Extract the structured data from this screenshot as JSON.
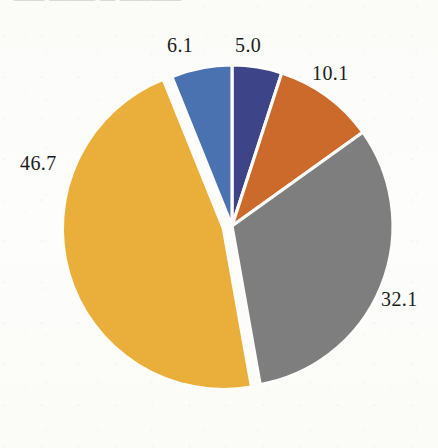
{
  "page": {
    "background_color": "#fdfdfb",
    "header_ghost_text": "——  ———  —  ————"
  },
  "chart_data": {
    "type": "pie",
    "title": "",
    "subtitle": "",
    "xlabel": "",
    "ylabel": "",
    "legend_position": "none",
    "grid": false,
    "total": 100.0,
    "start_angle_deg": -90,
    "direction": "clockwise",
    "exploded_slices": [
      "46.7"
    ],
    "categories": [
      "5.0",
      "10.1",
      "32.1",
      "46.7",
      "6.1"
    ],
    "values": [
      5.0,
      10.1,
      32.1,
      46.7,
      6.1
    ],
    "colors": [
      "#3d4488",
      "#cc6a2b",
      "#7e7e7e",
      "#e9af3a",
      "#4a72b0"
    ],
    "slices": [
      {
        "value": 5.0,
        "label": "5.0",
        "color": "#3d4488",
        "exploded": false
      },
      {
        "value": 10.1,
        "label": "10.1",
        "color": "#cc6a2b",
        "exploded": false
      },
      {
        "value": 32.1,
        "label": "32.1",
        "color": "#7e7e7e",
        "exploded": false
      },
      {
        "value": 46.7,
        "label": "46.7",
        "color": "#e9af3a",
        "exploded": true
      },
      {
        "value": 6.1,
        "label": "6.1",
        "color": "#4a72b0",
        "exploded": false
      }
    ],
    "data_labels": {
      "value_46_7": "46.7",
      "value_6_1": "6.1",
      "value_5_0": "5.0",
      "value_10_1": "10.1",
      "value_32_1": "32.1"
    },
    "slice_separator_color": "#fdfdfb",
    "label_text_color": "#1b1b1b"
  }
}
